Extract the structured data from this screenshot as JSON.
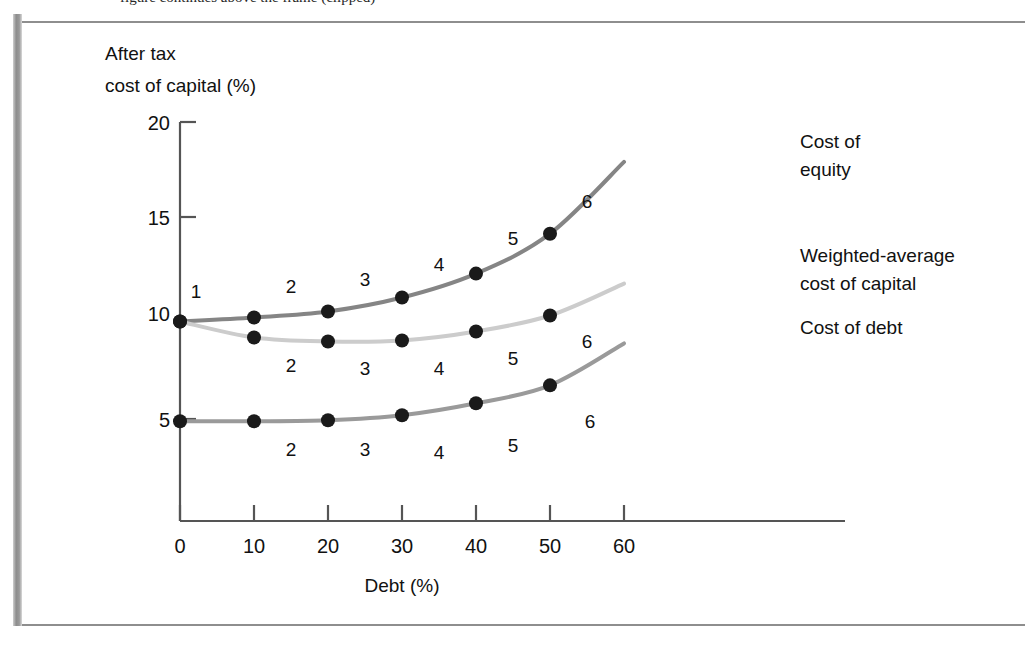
{
  "page": {
    "caption_partial": "figure continues above the frame (clipped)",
    "background_color": "#ffffff",
    "frame_color": "#8e8e8e"
  },
  "chart_data": {
    "type": "line",
    "title": "",
    "xlabel": "Debt (%)",
    "ylabel": "After tax\ncost of capital (%)",
    "ylabel_line1": "After tax",
    "ylabel_line2": "cost of capital (%)",
    "xlim": [
      0,
      60
    ],
    "ylim": [
      0,
      20
    ],
    "xticks": [
      0,
      10,
      20,
      30,
      40,
      50,
      60
    ],
    "xticklabels": [
      "0",
      "10",
      "20",
      "30",
      "40",
      "50",
      "60"
    ],
    "yticks": [
      0,
      5,
      10,
      15,
      20
    ],
    "yticklabels": [
      "0",
      "5",
      "10",
      "15",
      "20"
    ],
    "grid": false,
    "legend_position": "right-inline",
    "x": [
      0,
      10,
      20,
      30,
      40,
      50
    ],
    "point_labels": [
      "1",
      "2",
      "3",
      "4",
      "5",
      "6"
    ],
    "series": [
      {
        "name": "Cost of equity",
        "color": "#858585",
        "line_width": 4,
        "values": [
          10.0,
          10.2,
          10.5,
          11.2,
          12.4,
          14.4
        ],
        "extended_to_60": 18.0,
        "label_line1": "Cost of",
        "label_line2": "equity",
        "label_position": "above"
      },
      {
        "name": "Weighted-average cost of capital",
        "color": "#cccccc",
        "line_width": 4,
        "values": [
          10.0,
          9.2,
          9.0,
          9.05,
          9.5,
          10.3
        ],
        "extended_to_60": 11.9,
        "label_line1": "Weighted-average",
        "label_line2": "cost of capital",
        "label_position": "below"
      },
      {
        "name": "Cost of debt",
        "color": "#9a9a9a",
        "line_width": 4,
        "values": [
          5.0,
          5.0,
          5.05,
          5.3,
          5.9,
          6.8
        ],
        "extended_to_60": 8.9,
        "label_line1": "Cost of debt",
        "label_line2": "",
        "label_position": "below"
      }
    ],
    "marker": {
      "shape": "circle",
      "color": "#1a1a1a",
      "radius": 7
    }
  },
  "legend": {
    "items": [
      {
        "line1": "Cost of",
        "line2": "equity"
      },
      {
        "line1": "Weighted-average",
        "line2": "cost of capital"
      },
      {
        "line1": "Cost of debt",
        "line2": ""
      }
    ]
  },
  "axis": {
    "y_label_line1": "After tax",
    "y_label_line2": "cost of capital (%)",
    "x_label": "Debt (%)",
    "y_tick_20": "20",
    "y_tick_15": "15",
    "y_tick_10": "10",
    "y_tick_5": "5",
    "y_tick_0": "0",
    "x_tick_0": "0",
    "x_tick_10": "10",
    "x_tick_20": "20",
    "x_tick_30": "30",
    "x_tick_40": "40",
    "x_tick_50": "50",
    "x_tick_60": "60"
  },
  "labels": {
    "equity": [
      "1",
      "2",
      "3",
      "4",
      "5",
      "6"
    ],
    "wacc": [
      "2",
      "3",
      "4",
      "5",
      "6"
    ],
    "debt": [
      "2",
      "3",
      "4",
      "5",
      "6"
    ]
  }
}
